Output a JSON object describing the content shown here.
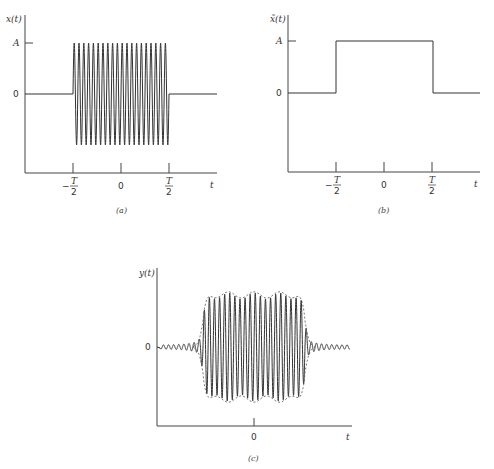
{
  "figure": {
    "panels": [
      {
        "id": "a",
        "caption": "(a)",
        "y_label": "x(t)",
        "x_label": "t",
        "y_ticks": [
          "A",
          "0"
        ],
        "x_ticks": [
          {
            "num": "T",
            "den": "2",
            "sign": "−"
          },
          {
            "label": "0"
          },
          {
            "num": "T",
            "den": "2",
            "sign": ""
          }
        ],
        "description": "Sinusoidal burst of amplitude A from −T/2 to T/2, zero elsewhere"
      },
      {
        "id": "b",
        "caption": "(b)",
        "y_label": "x̃(t)",
        "x_label": "t",
        "y_ticks": [
          "A",
          "0"
        ],
        "x_ticks": [
          {
            "num": "T",
            "den": "2",
            "sign": "−"
          },
          {
            "label": "0"
          },
          {
            "num": "T",
            "den": "2",
            "sign": ""
          }
        ],
        "description": "Rectangular envelope of height A from −T/2 to T/2"
      },
      {
        "id": "c",
        "caption": "(c)",
        "y_label": "y(t)",
        "x_label": "t",
        "y_ticks": [
          "0"
        ],
        "x_ticks": [
          {
            "label": "0"
          }
        ],
        "description": "Filtered burst with rippled envelope (dashed) and ringing tails"
      }
    ]
  },
  "chart_data": [
    {
      "type": "line",
      "title": "(a)",
      "xlabel": "t",
      "ylabel": "x(t)",
      "x_ticks": [
        "−T/2",
        "0",
        "T/2"
      ],
      "y_ticks": [
        "0",
        "A"
      ],
      "series": [
        {
          "name": "x(t)",
          "shape": "sinusoid burst",
          "amplitude": "A",
          "start": "−T/2",
          "end": "T/2",
          "cycles": 20
        }
      ],
      "grid": false
    },
    {
      "type": "line",
      "title": "(b)",
      "xlabel": "t",
      "ylabel": "x̃(t)",
      "x_ticks": [
        "−T/2",
        "0",
        "T/2"
      ],
      "y_ticks": [
        "0",
        "A"
      ],
      "series": [
        {
          "name": "x̃(t)",
          "shape": "rectangular pulse",
          "x": [
            "−∞",
            "−T/2",
            "−T/2",
            "T/2",
            "T/2",
            "∞"
          ],
          "y": [
            0,
            0,
            "A",
            "A",
            0,
            0
          ]
        }
      ],
      "grid": false
    },
    {
      "type": "line",
      "title": "(c)",
      "xlabel": "t",
      "ylabel": "y(t)",
      "x_ticks": [
        "0"
      ],
      "y_ticks": [
        "0"
      ],
      "series": [
        {
          "name": "y(t)",
          "shape": "band-limited burst with Gibbs ripple and ringing tails",
          "cycles": 20
        },
        {
          "name": "envelope",
          "style": "dashed",
          "shape": "rippled rectangular envelope with overshoot at edges"
        }
      ],
      "grid": false
    }
  ]
}
